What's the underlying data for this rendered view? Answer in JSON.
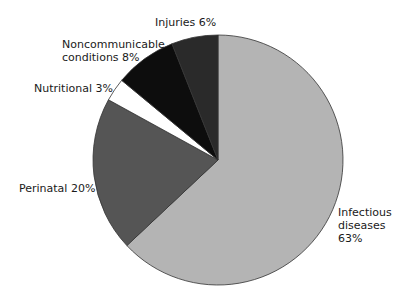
{
  "chart_data": {
    "type": "pie",
    "title": "",
    "categories": [
      "Infectious diseases",
      "Perinatal",
      "Nutritional",
      "Noncommunicable conditions",
      "Injuries"
    ],
    "values": [
      63,
      20,
      3,
      8,
      6
    ],
    "unit": "%",
    "colors": [
      "#b4b4b4",
      "#555555",
      "#ffffff",
      "#0d0d0d",
      "#2a2a2a"
    ],
    "legend": "none (direct labels)"
  },
  "labels": {
    "injuries": "Injuries 6%",
    "noncommunicable": "Noncommunicable\nconditions 8%",
    "nutritional": "Nutritional 3%",
    "perinatal": "Perinatal 20%",
    "infectious": "Infectious\ndiseases\n63%"
  }
}
